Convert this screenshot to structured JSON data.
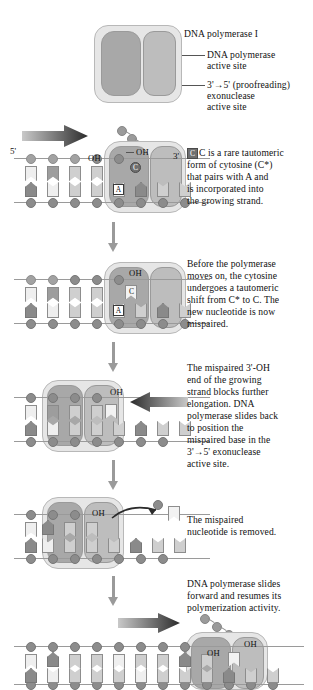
{
  "figure": {
    "colors": {
      "enzyme_body": "#e6e6e6",
      "polymerase_site": "#a8a8a8",
      "exonuclease_site": "#bdbdbd",
      "backbone": "#a2a2a2",
      "text": "#111111",
      "arrow": "#9a9a9a"
    }
  },
  "callouts": {
    "enzyme_name": "DNA polymerase I",
    "polymerase_site": "DNA polymerase\nactive site",
    "polymerase_site_line1": "DNA polymerase",
    "polymerase_site_line2": "active site",
    "exonuclease_line1": "3'→5' (proofreading)",
    "exonuclease_line2": "exonuclease",
    "exonuclease_line3": "active site"
  },
  "strand_labels": {
    "five_prime": "5'",
    "three_prime": "3'",
    "hydroxyl": "OH"
  },
  "base_letters": {
    "adenine": "A",
    "cytosine_tautomer": "C",
    "cytosine": "C"
  },
  "panels": [
    {
      "id": "panel-1",
      "caption_lines": [
        "C is a rare tautomeric",
        "form of cytosine (C*)",
        "that pairs with A and",
        "is incorporated into",
        "the growing strand."
      ],
      "caption_prefix_boxed": "C",
      "caption_rest": " is a rare tautomeric form of cytosine (C*) that pairs with A and is incorporated into the growing strand.",
      "direction_arrow": "right"
    },
    {
      "id": "panel-2",
      "caption_lines": [
        "Before the polymerase",
        "moves on, the cytosine",
        "undergoes a tautomeric",
        "shift from C* to C. The",
        "new nucleotide is now",
        "mispaired."
      ],
      "direction_arrow": "none"
    },
    {
      "id": "panel-3",
      "caption_lines": [
        "The mispaired 3'-OH",
        "end of the growing",
        "strand blocks further",
        "elongation.  DNA",
        "polymerase slides back",
        "to position the",
        "mispaired base in the",
        "3'→5' exonuclease",
        "active site."
      ],
      "direction_arrow": "left"
    },
    {
      "id": "panel-4",
      "caption_lines": [
        "The mispaired",
        "nucleotide is removed."
      ],
      "direction_arrow": "none"
    },
    {
      "id": "panel-5",
      "caption_lines": [
        "DNA polymerase slides",
        "forward and resumes its",
        "polymerization activity."
      ],
      "direction_arrow": "right"
    }
  ]
}
